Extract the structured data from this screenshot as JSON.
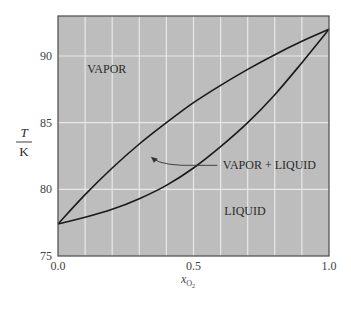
{
  "chart_data": {
    "type": "line",
    "title": "",
    "xlabel": "x_O2",
    "xlabel_main": "x",
    "xlabel_sub": "O",
    "xlabel_subsub": "2",
    "ylabel_num": "T",
    "ylabel_den": "K",
    "xlim": [
      0.0,
      1.0
    ],
    "ylim": [
      75,
      93
    ],
    "x_ticks": [
      0.0,
      0.5,
      1.0
    ],
    "x_tick_labels": [
      "0.0",
      "0.5",
      "1.0"
    ],
    "y_ticks": [
      75,
      80,
      85,
      90
    ],
    "y_tick_labels": [
      "75",
      "80",
      "85",
      "90"
    ],
    "grid": true,
    "grid_x_step": 0.1,
    "grid_y_step": 5,
    "background_color": "#bdbdbd",
    "grid_color": "#e8e8e8",
    "line_color": "#1a1a1a",
    "series": [
      {
        "name": "Dew point curve (vapor)",
        "x": [
          0.0,
          0.1,
          0.2,
          0.3,
          0.4,
          0.5,
          0.6,
          0.7,
          0.8,
          0.9,
          1.0
        ],
        "values": [
          77.4,
          79.6,
          81.6,
          83.4,
          85.0,
          86.5,
          87.8,
          89.0,
          90.1,
          91.1,
          92.0
        ]
      },
      {
        "name": "Bubble point curve (liquid)",
        "x": [
          0.0,
          0.1,
          0.2,
          0.3,
          0.4,
          0.5,
          0.6,
          0.7,
          0.8,
          0.9,
          1.0
        ],
        "values": [
          77.4,
          77.9,
          78.5,
          79.3,
          80.3,
          81.6,
          83.2,
          85.0,
          87.1,
          89.5,
          92.0
        ]
      }
    ],
    "annotations": [
      {
        "text": "VAPOR",
        "x": 0.18,
        "y": 89.0
      },
      {
        "text": "VAPOR + LIQUID",
        "x": 0.78,
        "y": 81.8,
        "arrow_to": [
          0.35,
          82.3
        ]
      },
      {
        "text": "LIQUID",
        "x": 0.69,
        "y": 78.4
      }
    ]
  }
}
